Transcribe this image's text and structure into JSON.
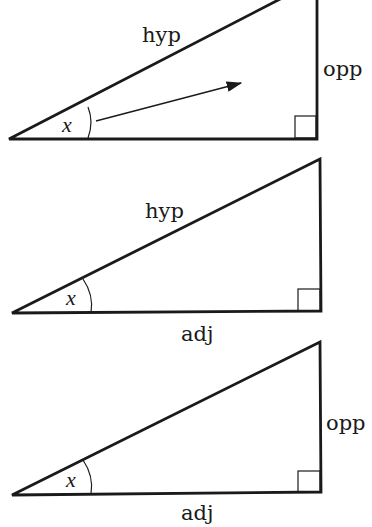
{
  "diagram": {
    "type": "right-triangle-trig-labels",
    "colors": {
      "line": "#1a1a1a",
      "background": "#ffffff"
    },
    "triangles": [
      {
        "id": "top",
        "angle_label": "x",
        "labels": {
          "hyp": "hyp",
          "opp": "opp"
        },
        "has_arrow": true
      },
      {
        "id": "middle",
        "angle_label": "x",
        "labels": {
          "hyp": "hyp",
          "adj": "adj"
        },
        "has_arrow": false
      },
      {
        "id": "bottom",
        "angle_label": "x",
        "labels": {
          "opp": "opp",
          "adj": "adj"
        },
        "has_arrow": false
      }
    ]
  }
}
